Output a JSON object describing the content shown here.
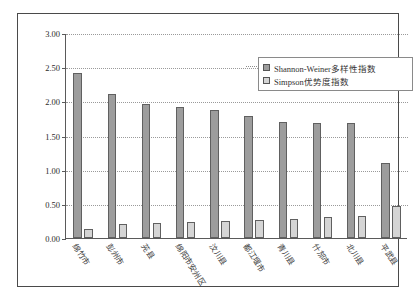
{
  "caption": {
    "clipped_header_text": "            "
  },
  "legend": {
    "position": "inside-top-right",
    "entries": [
      {
        "label": "Shannon-Weiner多样性指数",
        "swatch_color": "#9d9d9d"
      },
      {
        "label": "Simpson优势度指数",
        "swatch_color": "#d5d5d5"
      }
    ]
  },
  "axes": {
    "y_ticks": [
      "0.00",
      "0.50",
      "1.00",
      "1.50",
      "2.00",
      "2.50",
      "3.00"
    ],
    "y_min": 0,
    "y_max": 3,
    "y_step": 0.5,
    "grid": true
  },
  "chart_data": {
    "type": "bar",
    "title": "",
    "xlabel": "",
    "ylabel": "",
    "ylim": [
      0,
      3
    ],
    "yticks": [
      0,
      0.5,
      1,
      1.5,
      2,
      2.5,
      3
    ],
    "grid": true,
    "legend_position": "inside-top-right",
    "categories": [
      "绵竹市",
      "彭州市",
      "茪县",
      "绵阳市安州区",
      "汶川县",
      "都江堰市",
      "青川县",
      "什邡市",
      "北川县",
      "平武县"
    ],
    "series": [
      {
        "name": "Shannon-Weiner多样性指数",
        "color": "#9d9d9d",
        "values": [
          2.42,
          2.11,
          1.96,
          1.91,
          1.87,
          1.79,
          1.7,
          1.69,
          1.68,
          1.1
        ]
      },
      {
        "name": "Simpson优势度指数",
        "color": "#d5d5d5",
        "values": [
          0.13,
          0.21,
          0.22,
          0.24,
          0.25,
          0.27,
          0.28,
          0.31,
          0.32,
          0.47
        ]
      }
    ]
  }
}
